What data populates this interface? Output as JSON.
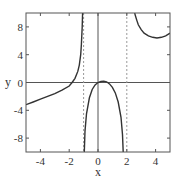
{
  "chart_data": {
    "type": "line",
    "title": "",
    "xlabel": "x",
    "ylabel": "y",
    "xlim": [
      -5,
      5
    ],
    "ylim": [
      -10,
      10
    ],
    "grid": false,
    "legend": null,
    "xticks": [
      -4,
      -2,
      0,
      2,
      4
    ],
    "yticks": [
      8,
      4,
      0,
      -4,
      -8
    ],
    "xtick_labels": [
      "-4",
      "-2",
      "0",
      "2",
      "4"
    ],
    "ytick_labels": [
      "8",
      "4",
      "0",
      "-4",
      "-8"
    ],
    "reference_lines": [
      {
        "type": "horizontal",
        "y": 0,
        "style": "solid"
      },
      {
        "type": "vertical",
        "x": 0,
        "style": "solid"
      },
      {
        "type": "vertical",
        "x": -1,
        "style": "dashed",
        "label": "asymptote"
      },
      {
        "type": "vertical",
        "x": 2,
        "style": "dashed",
        "label": "asymptote"
      }
    ],
    "series": [
      {
        "name": "left-branch",
        "x": [
          -5,
          -4.5,
          -4,
          -3.5,
          -3,
          -2.5,
          -2,
          -1.8,
          -1.6,
          -1.4,
          -1.3,
          -1.2,
          -1.15,
          -1.1,
          -1.07
        ],
        "y": [
          -3.2,
          -2.8,
          -2.4,
          -2.0,
          -1.6,
          -1.1,
          -0.5,
          0.0,
          0.6,
          1.6,
          2.5,
          4.0,
          5.5,
          8.0,
          10
        ]
      },
      {
        "name": "middle-branch",
        "x": [
          -0.95,
          -0.9,
          -0.8,
          -0.6,
          -0.4,
          -0.2,
          0.0,
          0.2,
          0.4,
          0.6,
          0.8,
          1.0,
          1.2,
          1.4,
          1.6,
          1.7,
          1.75
        ],
        "y": [
          -10,
          -7.0,
          -4.5,
          -2.2,
          -1.0,
          -0.35,
          0.0,
          0.15,
          0.2,
          0.1,
          -0.2,
          -0.7,
          -1.5,
          -2.8,
          -5.0,
          -7.5,
          -10
        ]
      },
      {
        "name": "right-branch",
        "x": [
          2.55,
          2.6,
          2.7,
          2.8,
          3.0,
          3.2,
          3.5,
          3.8,
          4.1,
          4.4,
          4.7,
          5.0
        ],
        "y": [
          10,
          9.6,
          8.9,
          8.3,
          7.6,
          7.1,
          6.7,
          6.5,
          6.4,
          6.5,
          6.7,
          7.1
        ]
      }
    ]
  },
  "colors": {
    "curve": "#333333",
    "axes": "#555555",
    "asymptote": "#999999"
  }
}
